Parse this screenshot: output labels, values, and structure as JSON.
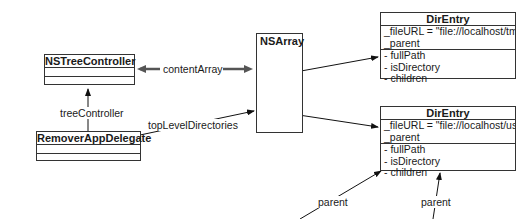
{
  "classes": {
    "tree_controller": {
      "name": "NSTreeController"
    },
    "app_delegate": {
      "name": "RemoverAppDelegate"
    },
    "array": {
      "name": "NSArray"
    },
    "dir_entry_tmp": {
      "name": "DirEntry",
      "ivars": [
        "_fileURL = \"file://localhost/tmp",
        "_parent"
      ],
      "methods": [
        "- fullPath",
        "- isDirectory",
        "- children"
      ]
    },
    "dir_entry_usr": {
      "name": "DirEntry",
      "ivars": [
        "_fileURL = \"file://localhost/usr\"",
        "_parent"
      ],
      "methods": [
        "- fullPath",
        "- isDirectory",
        "- children"
      ]
    }
  },
  "relations": {
    "content_array": "contentArray",
    "tree_controller": "treeController",
    "top_level_directories": "topLevelDirectories",
    "parent_left": "parent",
    "parent_right": "parent"
  }
}
